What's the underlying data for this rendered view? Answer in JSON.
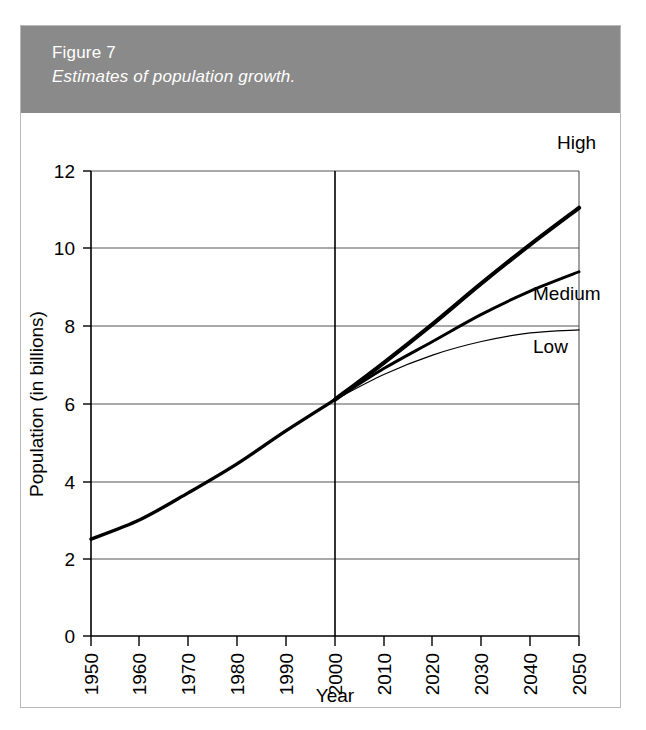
{
  "figure": {
    "number": "Figure 7",
    "caption": "Estimates of population growth.",
    "header_color": "#8a8a8a",
    "header_text_color": "#ffffff"
  },
  "chart_data": {
    "type": "line",
    "title": "Estimates of population growth.",
    "xlabel": "Year",
    "ylabel": "Population (in billions)",
    "xlim": [
      1950,
      2050
    ],
    "ylim": [
      0,
      12
    ],
    "xticks": [
      1950,
      1960,
      1970,
      1980,
      1990,
      2000,
      2010,
      2020,
      2030,
      2040,
      2050
    ],
    "xtick_labels": [
      "1950",
      "1960",
      "1970",
      "1980",
      "1990",
      "2000",
      "2010",
      "2020",
      "2030",
      "2040",
      "2050"
    ],
    "yticks": [
      0,
      2,
      4,
      6,
      8,
      10,
      12
    ],
    "ytick_labels": [
      "0",
      "2",
      "4",
      "6",
      "8",
      "10",
      "12"
    ],
    "grid": "horizontal gridlines at 2,4,6,8,10,12; vertical reference line at 2000",
    "legend_position": "inline-right-of-series",
    "x": [
      1950,
      1960,
      1970,
      1980,
      1990,
      2000,
      2010,
      2020,
      2030,
      2040,
      2050
    ],
    "series": [
      {
        "name": "High",
        "label": "High",
        "line_width": "thick",
        "values": [
          2.5,
          3.0,
          3.7,
          4.45,
          5.3,
          6.1,
          7.05,
          8.05,
          9.1,
          10.1,
          11.05
        ]
      },
      {
        "name": "Medium",
        "label": "Medium",
        "line_width": "medium",
        "values": [
          2.5,
          3.0,
          3.7,
          4.45,
          5.3,
          6.1,
          6.9,
          7.6,
          8.3,
          8.9,
          9.4
        ]
      },
      {
        "name": "Low",
        "label": "Low",
        "line_width": "thin",
        "values": [
          2.5,
          3.0,
          3.7,
          4.45,
          5.3,
          6.1,
          6.75,
          7.25,
          7.6,
          7.82,
          7.9
        ]
      }
    ]
  },
  "series_labels": {
    "high": "High",
    "medium": "Medium",
    "low": "Low"
  }
}
